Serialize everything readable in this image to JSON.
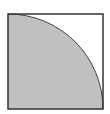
{
  "diagram": {
    "type": "geometry",
    "square": {
      "x": 8,
      "y": 14,
      "size": 95,
      "stroke": "#333333",
      "stroke_width": 1.5,
      "fill": "#ffffff"
    },
    "quarter_circle": {
      "center": "bottom-left corner",
      "cx": 8,
      "cy": 109,
      "radius": 95,
      "fill": "#c0c0c0",
      "stroke": "#444444"
    },
    "colors": {
      "background": "#ffffff",
      "shade": "#c0c0c0",
      "outline": "#333333"
    }
  }
}
